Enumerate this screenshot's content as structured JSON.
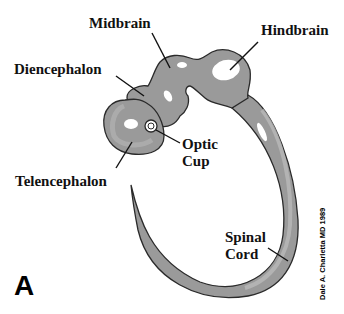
{
  "labels": {
    "midbrain": "Midbrain",
    "hindbrain": "Hindbrain",
    "diencephalon": "Diencephalon",
    "optic_cup_line1": "Optic",
    "optic_cup_line2": "Cup",
    "telencephalon": "Telencephalon",
    "spinal_cord_line1": "Spinal",
    "spinal_cord_line2": "Cord"
  },
  "panel_letter": "A",
  "credit": "Dale A. Charletta MD 1989",
  "colors": {
    "tissue_fill": "#9a9a9a",
    "tissue_light": "#b8b8b8",
    "outline": "#2a2a2a",
    "highlight": "#ffffff"
  }
}
